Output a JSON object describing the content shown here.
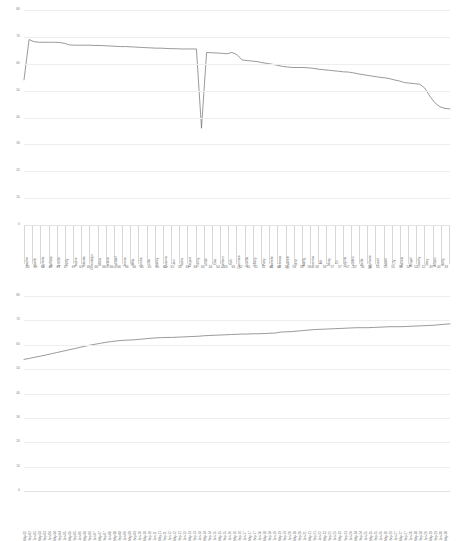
{
  "chart_data": [
    {
      "id": "top",
      "type": "line",
      "title": "",
      "xlabel": "",
      "ylabel": "",
      "ylim": [
        0,
        80
      ],
      "yticks": [
        80,
        70,
        60,
        50,
        40,
        30,
        20,
        10,
        0
      ],
      "grid": true,
      "legend": "none",
      "categories": [
        "Heather",
        "Noelle",
        "Ophelia",
        "Barbara",
        "Jennifer",
        "Kelly",
        "Sophie",
        "Yolanda",
        "Gwendolyn",
        "Gloria",
        "Melanie",
        "Rachael",
        "Teresa",
        "Willa",
        "Cecilia",
        "Lola",
        "Nancy",
        "Quianna",
        "Jani",
        "Tasha",
        "Karyani",
        "Fanny",
        "Leslie",
        "Elsa",
        "Kathleen",
        "Ruth",
        "Dominica",
        "Drucilla",
        "Tiffany",
        "Patty",
        "Rochelle",
        "Rebecca",
        "Elizabeth",
        "Jenn",
        "Adelly",
        "Veronica",
        "Abi",
        "Missy",
        "Eri",
        "Virginia",
        "Lourdes",
        "Nellie",
        "Stephanie",
        "Carol",
        "Isabel",
        "Lily",
        "Patricia",
        "Abigail",
        "Dorothy",
        "Zoey",
        "Allison",
        "Betty"
      ],
      "secondary_axis_values": [
        70,
        69,
        68,
        67,
        67,
        67,
        67,
        67,
        68,
        66,
        66,
        66,
        66,
        66,
        66,
        65,
        65,
        65,
        65,
        65,
        65,
        65,
        64,
        64,
        64,
        64,
        63,
        63,
        62,
        61,
        61,
        61,
        60,
        60,
        59,
        58,
        58,
        58,
        58,
        58,
        57,
        57,
        57,
        57,
        56,
        56,
        55,
        55,
        55,
        54,
        54,
        52,
        52,
        49,
        44,
        43
      ],
      "values": [
        54,
        69,
        68.2,
        68,
        68,
        68,
        68,
        67.9,
        67.6,
        67,
        66.9,
        66.9,
        66.9,
        66.9,
        66.8,
        66.8,
        66.7,
        66.6,
        66.5,
        66.4,
        66.4,
        66.3,
        66.2,
        66.1,
        66,
        65.9,
        65.8,
        65.8,
        65.7,
        65.6,
        65.6,
        65.5,
        65.5,
        65.5,
        65.5,
        36,
        64.2,
        64.1,
        64,
        63.9,
        63.7,
        64.2,
        63.4,
        61.4,
        61.2,
        61,
        60.8,
        60.4,
        60.1,
        59.8,
        59.4,
        59,
        58.8,
        58.6,
        58.6,
        58.6,
        58.5,
        58.3,
        58,
        57.8,
        57.6,
        57.4,
        57.2,
        57,
        56.9,
        56.6,
        56.2,
        55.9,
        55.6,
        55.3,
        55,
        54.8,
        54.5,
        54,
        53.6,
        53,
        52.8,
        52.6,
        52.4,
        51,
        48,
        45.5,
        44,
        43.4,
        43.2
      ]
    },
    {
      "id": "bottom",
      "type": "line",
      "title": "",
      "xlabel": "",
      "ylabel": "",
      "ylim": [
        0,
        80
      ],
      "yticks": [
        80,
        70,
        60,
        50,
        40,
        30,
        20,
        10,
        0
      ],
      "grid": true,
      "legend": "none",
      "categories": [
        "May-02",
        "Sep-02",
        "Jan-03",
        "May-03",
        "Sep-03",
        "Jan-04",
        "May-04",
        "Sep-04",
        "Jan-05",
        "May-05",
        "Sep-05",
        "Jan-06",
        "May-06",
        "Sep-06",
        "Jan-07",
        "May-07",
        "Sep-07",
        "Jan-08",
        "May-08",
        "Sep-08",
        "Jan-09",
        "May-09",
        "Sep-09",
        "Jan-10",
        "May-10",
        "Sep-10",
        "Jan-11",
        "May-11",
        "Sep-11",
        "Jan-12",
        "May-12",
        "Sep-12",
        "Jan-13",
        "May-13",
        "Sep-13",
        "Jan-14",
        "May-14",
        "Sep-14",
        "Jan-15",
        "May-15",
        "Sep-15",
        "Jan-16",
        "May-16",
        "Sep-16",
        "Jan-17",
        "May-17",
        "Sep-17",
        "Jan-18",
        "May-18",
        "Sep-18",
        "Jan-19",
        "May-19",
        "Sep-19",
        "Jan-20",
        "May-20",
        "Sep-20",
        "Jan-21",
        "May-21",
        "Sep-21",
        "Jan-22",
        "May-22",
        "Sep-22",
        "Jan-23",
        "May-23",
        "Sep-23",
        "Jan-24",
        "May-24",
        "Sep-24",
        "Jan-25",
        "May-25",
        "Sep-25",
        "Jan-26",
        "May-26",
        "Sep-26",
        "Jan-27",
        "May-27",
        "Sep-27",
        "Jan-28",
        "May-28",
        "Sep-28",
        "Jan-29",
        "May-29",
        "Sep-29",
        "Jan-30",
        "May-30"
      ],
      "values": [
        54.0,
        54.4,
        54.9,
        55.3,
        55.8,
        56.3,
        56.8,
        57.3,
        57.8,
        58.3,
        58.8,
        59.3,
        59.8,
        60.2,
        60.6,
        61.0,
        61.3,
        61.6,
        61.8,
        61.9,
        62.0,
        62.2,
        62.4,
        62.6,
        62.8,
        62.9,
        63.0,
        63.0,
        63.1,
        63.2,
        63.3,
        63.4,
        63.5,
        63.7,
        63.8,
        63.9,
        64.0,
        64.1,
        64.2,
        64.3,
        64.4,
        64.4,
        64.5,
        64.5,
        64.6,
        64.7,
        64.8,
        65.2,
        65.3,
        65.4,
        65.6,
        65.8,
        66.0,
        66.2,
        66.3,
        66.4,
        66.5,
        66.6,
        66.7,
        66.8,
        66.9,
        67.0,
        67.0,
        67.0,
        67.1,
        67.2,
        67.3,
        67.4,
        67.4,
        67.4,
        67.5,
        67.6,
        67.7,
        67.8,
        67.9,
        68.0,
        68.2,
        68.4,
        68.6
      ]
    }
  ]
}
